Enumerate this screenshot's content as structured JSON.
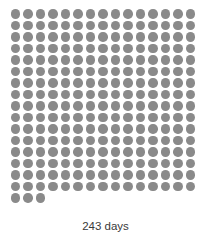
{
  "figure": {
    "caption": "243 days",
    "background_color": "#ffffff"
  },
  "chart_data": {
    "type": "pictogram",
    "title": "",
    "subtitle": "",
    "xlabel": "",
    "ylabel": "",
    "unit_label": "days",
    "total_units": 243,
    "value": 243,
    "marker": {
      "shape": "circle",
      "color": "#8a8a8a",
      "diameter_px": 9.5
    },
    "grid": {
      "columns": 15,
      "full_rows": 16,
      "last_row_count": 3,
      "total_rows": 17,
      "fill_order": "left-to-right, top-to-bottom",
      "column_spacing_px": 12.5,
      "row_spacing_px": 11.5
    },
    "legend": [],
    "annotations": [
      {
        "text": "243 days",
        "position": "below-grid-center"
      }
    ],
    "categories": [
      "days"
    ],
    "values": [
      243
    ]
  }
}
